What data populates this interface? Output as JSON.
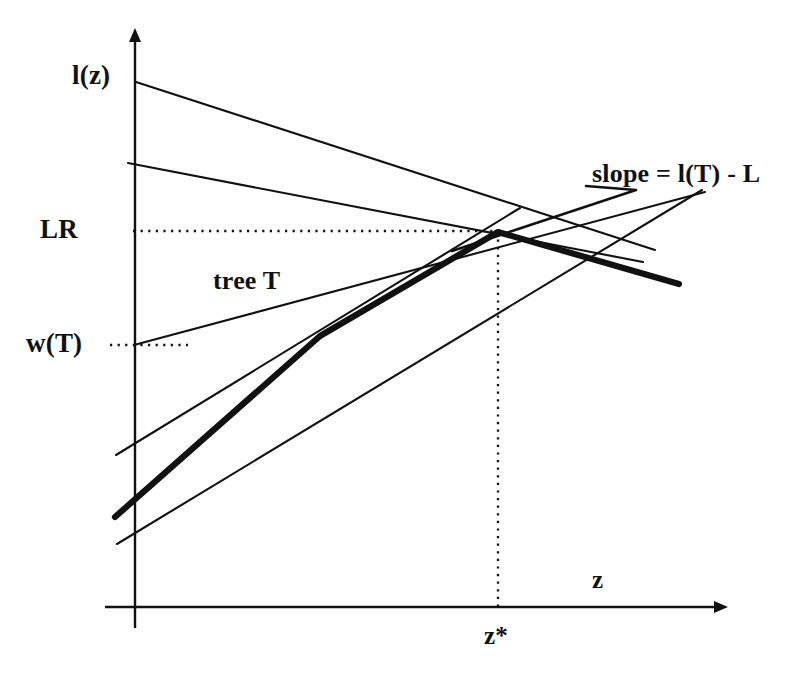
{
  "figure": {
    "background_color": "#ffffff",
    "ink_color": "#111111",
    "width": 804,
    "height": 686
  },
  "labels": {
    "l_of_z": "l(z)",
    "lr": "LR",
    "w_of_t": "w(T)",
    "tree_t": "tree T",
    "slope": "slope = l(T) - L",
    "x_axis": "z",
    "z_star": "z*"
  },
  "chart_data": {
    "type": "line",
    "title": "",
    "xlabel": "z",
    "ylabel": "",
    "grid": false,
    "legend": null,
    "axes": {
      "origin_px": [
        135,
        607
      ],
      "x_axis_px": {
        "x1": 105,
        "y1": 607,
        "x2": 722,
        "y2": 607,
        "arrow": "right"
      },
      "y_axis_px": {
        "x1": 135,
        "y1": 625,
        "x2": 135,
        "y2": 30,
        "arrow": "up"
      }
    },
    "annotations": [
      {
        "name": "lr-level",
        "label": "LR",
        "type": "horizontal-dotted",
        "y_px": 231,
        "x_from_px": 133,
        "x_to_px": 498
      },
      {
        "name": "wt-level",
        "label": "w(T)",
        "type": "horizontal-dotted",
        "y_px": 345,
        "x_from_px": 110,
        "x_to_px": 188
      },
      {
        "name": "zstar-drop",
        "label": "z*",
        "type": "vertical-dotted",
        "x_px": 498,
        "y_from_px": 232,
        "y_to_px": 607
      }
    ],
    "series": [
      {
        "name": "concave-envelope",
        "style": "thick",
        "points_px": [
          [
            115,
            517
          ],
          [
            320,
            336
          ],
          [
            498,
            232
          ],
          [
            679,
            284
          ]
        ]
      },
      {
        "name": "l-of-z-line",
        "style": "thin",
        "points_px": [
          [
            136,
            82
          ],
          [
            655,
            250
          ]
        ]
      },
      {
        "name": "upper-chord-line",
        "style": "thin",
        "points_px": [
          [
            128,
            163
          ],
          [
            643,
            262
          ]
        ]
      },
      {
        "name": "tree-T-line",
        "style": "thin",
        "points_px": [
          [
            134,
            345
          ],
          [
            705,
            192
          ]
        ]
      },
      {
        "name": "supporting-line-low",
        "style": "thin",
        "points_px": [
          [
            116,
            455
          ],
          [
            520,
            208
          ]
        ]
      },
      {
        "name": "tangent-at-zstar",
        "style": "thin",
        "points_px": [
          [
            117,
            544
          ],
          [
            702,
            190
          ]
        ]
      },
      {
        "name": "slope-leader",
        "style": "thin-leader",
        "points_px": [
          [
            452,
            251
          ],
          [
            636,
            190
          ],
          [
            586,
            186
          ]
        ]
      }
    ]
  }
}
